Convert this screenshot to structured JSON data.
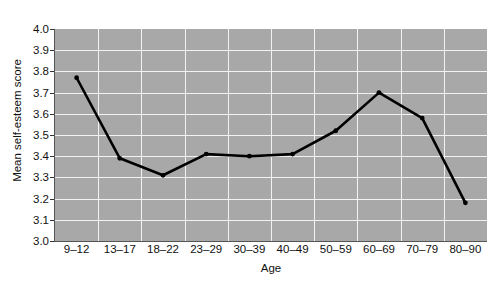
{
  "chart_data": {
    "type": "line",
    "title": "",
    "xlabel": "Age",
    "ylabel": "Mean self-esteem score",
    "categories": [
      "9–12",
      "13–17",
      "18–22",
      "23–29",
      "30–39",
      "40–49",
      "50–59",
      "60–69",
      "70–79",
      "80–90"
    ],
    "values": [
      3.77,
      3.39,
      3.31,
      3.41,
      3.4,
      3.41,
      3.52,
      3.7,
      3.58,
      3.18
    ],
    "ylim": [
      3.0,
      4.0
    ],
    "ytick_labels": [
      "3.0",
      "3.1",
      "3.2",
      "3.3",
      "3.4",
      "3.5",
      "3.6",
      "3.7",
      "3.8",
      "3.9",
      "4.0"
    ],
    "ytick_values": [
      3.0,
      3.1,
      3.2,
      3.3,
      3.4,
      3.5,
      3.6,
      3.7,
      3.8,
      3.9,
      4.0
    ],
    "grid": true,
    "legend": "none",
    "series": [
      {
        "name": "Mean self-esteem score",
        "values": [
          3.77,
          3.39,
          3.31,
          3.41,
          3.4,
          3.41,
          3.52,
          3.7,
          3.58,
          3.18
        ]
      }
    ],
    "colors": {
      "plot_background": "#a8a8a8",
      "figure_background": "#ffffff",
      "gridline": "#f2f2f2",
      "line": "#000000",
      "marker": "#000000",
      "text": "#111111",
      "axis": "#555555"
    }
  }
}
